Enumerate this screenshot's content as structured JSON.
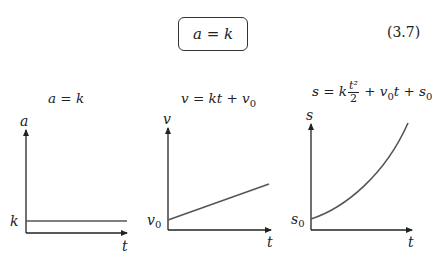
{
  "equation": {
    "boxed": "a = k",
    "number": "(3.7)"
  },
  "graphs": [
    {
      "title": "a = k",
      "y_label": "a",
      "x_label": "t",
      "intercept_label": "k",
      "shape": "constant"
    },
    {
      "title_parts": {
        "lhs": "v = kt + v",
        "sub": "0"
      },
      "y_label": "v",
      "x_label": "t",
      "intercept_label": "v",
      "intercept_sub": "0",
      "shape": "linear"
    },
    {
      "title_parts": {
        "lhs": "s = k",
        "frac_num": "t²",
        "frac_den": "2",
        "mid": "+ v",
        "sub1": "0",
        "rest": "t + s",
        "sub2": "0"
      },
      "y_label": "s",
      "x_label": "t",
      "intercept_label": "s",
      "intercept_sub": "0",
      "shape": "quadratic"
    }
  ],
  "colors": {
    "axis": "#222222",
    "curve": "#555555"
  }
}
